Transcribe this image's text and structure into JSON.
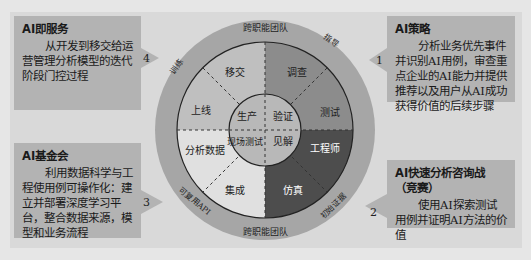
{
  "boxes": {
    "service": {
      "number": "4",
      "title": "AI即服务",
      "body": "从开发到移交给运营管理分析模型的迭代阶段门控过程"
    },
    "strategy": {
      "number": "1",
      "title": "AI策略",
      "body": "分析业务优先事件并识别AI用例，审查重点企业的AI能力并提供推荐以及用户从AI成功获得价值的后续步骤"
    },
    "foundation": {
      "number": "3",
      "title": "AI基金会",
      "body": "利用数据科学与工程使用例可操作化：建立并部署深度学习平台，整合数据来源，模型和业务流程"
    },
    "challenge": {
      "number": "2",
      "title": "AI快速分析咨询战（竞赛）",
      "body": "使用AI探索测试用例并证明AI方法的价值"
    }
  },
  "wheel": {
    "outer_ring": {
      "top": "跨职能团队",
      "bottom": "跨职能团队",
      "upper_left": "训练",
      "upper_right": "指导",
      "lower_left": "可复用API",
      "lower_right": "初始证据"
    },
    "segments": {
      "transfer": "移交",
      "review": "调查",
      "go_live": "上线",
      "test": "测试",
      "analyze_data": "分析数据",
      "engineer": "工程师",
      "integrate": "集成",
      "simulate": "仿真"
    },
    "inner": {
      "production": "生产",
      "validation": "验证",
      "field_test": "现场测试",
      "insight": "见解"
    }
  },
  "colors": {
    "background": "#e6e6e6",
    "frame": "#d9d9d9",
    "box": "#b3b3b3",
    "outer_ring": "#a6a6a6",
    "quad_upper_left": "#bfbfbf",
    "quad_upper_right": "#8c8c8c",
    "quad_lower_left": "#e0e0e0",
    "quad_lower_right": "#4d4d4d",
    "inner_circle": "#b8b8b8"
  }
}
